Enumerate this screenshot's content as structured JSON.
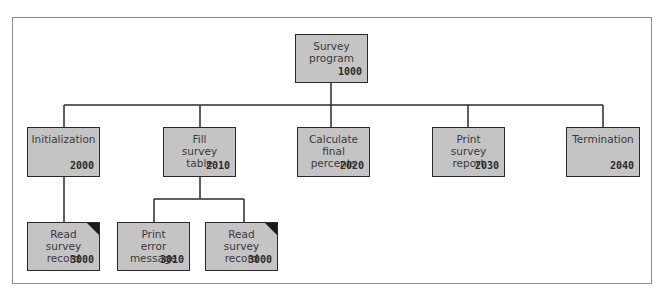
{
  "diagram": {
    "type": "structure-chart",
    "colors": {
      "box_fill": "#c4c4c4",
      "box_border": "#2a2a2a",
      "frame": "#8a8a8a",
      "line": "#2a2a2a"
    },
    "root": {
      "label": "Survey\nprogram",
      "code": "1000",
      "x": 295,
      "y": 34,
      "w": 73,
      "h": 49
    },
    "level2": [
      {
        "label": "Initialization",
        "code": "2000",
        "x": 27,
        "y": 127,
        "w": 73,
        "h": 50
      },
      {
        "label": "Fill\nsurvey\ntable",
        "code": "2010",
        "x": 163,
        "y": 127,
        "w": 73,
        "h": 50
      },
      {
        "label": "Calculate\nfinal\npercents",
        "code": "2020",
        "x": 297,
        "y": 127,
        "w": 73,
        "h": 50
      },
      {
        "label": "Print\nsurvey\nreport",
        "code": "2030",
        "x": 432,
        "y": 127,
        "w": 73,
        "h": 50
      },
      {
        "label": "Termination",
        "code": "2040",
        "x": 566,
        "y": 127,
        "w": 74,
        "h": 50
      }
    ],
    "level3": [
      {
        "label": "Read\nsurvey\nrecord",
        "code": "3000",
        "parent": "2000",
        "shared_module": true,
        "x": 27,
        "y": 222,
        "w": 73,
        "h": 49
      },
      {
        "label": "Print\nerror\nmessage",
        "code": "3010",
        "parent": "2010",
        "shared_module": false,
        "x": 117,
        "y": 222,
        "w": 73,
        "h": 49
      },
      {
        "label": "Read\nsurvey\nrecord",
        "code": "3000",
        "parent": "2010",
        "shared_module": true,
        "x": 205,
        "y": 222,
        "w": 73,
        "h": 49
      }
    ]
  }
}
